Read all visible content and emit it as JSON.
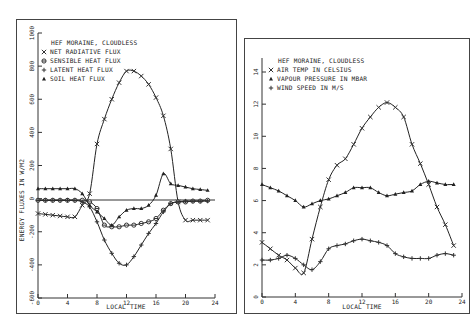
{
  "chart_data": [
    {
      "type": "line",
      "title": "HEF MORAINE, CLOUDLESS",
      "xlabel": "LOCAL TIME",
      "ylabel": "ENERGY FLUXES IN W/M2",
      "xlim": [
        0,
        24
      ],
      "ylim": [
        -600,
        1000
      ],
      "x_ticks": [
        "0",
        "4",
        "8",
        "12",
        "16",
        "20",
        "24"
      ],
      "y_ticks": [
        "1000",
        "800",
        "600",
        "400",
        "200",
        "0",
        "-200",
        "-400",
        "-600"
      ],
      "grid": false,
      "zero_line": true,
      "legend_position": "upper-left",
      "x": [
        0,
        1,
        2,
        3,
        4,
        5,
        6,
        7,
        8,
        9,
        10,
        11,
        12,
        13,
        14,
        15,
        16,
        17,
        18,
        19,
        20,
        21,
        22,
        23
      ],
      "series": [
        {
          "name": "NET RADIATIVE FLUX",
          "marker": "x",
          "values": [
            -90,
            -95,
            -100,
            -105,
            -110,
            -110,
            -40,
            30,
            330,
            480,
            600,
            700,
            770,
            770,
            740,
            690,
            610,
            500,
            300,
            -20,
            -130,
            -130,
            -130,
            -130
          ]
        },
        {
          "name": "SENSIBLE HEAT FLUX",
          "marker": "circle",
          "values": [
            -10,
            -10,
            -10,
            -10,
            -10,
            -10,
            -10,
            -20,
            -60,
            -160,
            -170,
            -170,
            -160,
            -160,
            -150,
            -140,
            -120,
            -70,
            -30,
            -20,
            -20,
            -15,
            -15,
            -10
          ]
        },
        {
          "name": "LATENT HEAT FLUX",
          "marker": "plus",
          "values": [
            -10,
            -10,
            -10,
            -10,
            -10,
            -10,
            -20,
            -50,
            -140,
            -250,
            -330,
            -390,
            -400,
            -350,
            -280,
            -210,
            -150,
            -80,
            -30,
            -20,
            -15,
            -15,
            -15,
            -15
          ]
        },
        {
          "name": "SOIL HEAT FLUX",
          "marker": "triangle",
          "values": [
            60,
            60,
            60,
            60,
            60,
            60,
            30,
            -40,
            -80,
            -120,
            -160,
            -110,
            -70,
            -60,
            -60,
            -40,
            20,
            150,
            90,
            80,
            70,
            60,
            55,
            50
          ]
        }
      ]
    },
    {
      "type": "line",
      "title": "HEF MORAINE, CLOUDLESS",
      "xlabel": "LOCAL TIME",
      "ylabel": "",
      "xlim": [
        0,
        24
      ],
      "ylim": [
        0,
        14
      ],
      "x_ticks": [
        "0",
        "4",
        "8",
        "12",
        "16",
        "20",
        "24"
      ],
      "y_ticks": [
        "14",
        "12",
        "10",
        "8",
        "6",
        "4",
        "2",
        "0"
      ],
      "grid": false,
      "legend_position": "upper-left",
      "x": [
        0,
        1,
        2,
        3,
        4,
        5,
        6,
        7,
        8,
        9,
        10,
        11,
        12,
        13,
        14,
        15,
        16,
        17,
        18,
        19,
        20,
        21,
        22,
        23
      ],
      "series": [
        {
          "name": "AIR TEMP IN CELSIUS",
          "marker": "x",
          "values": [
            3.4,
            3.0,
            2.6,
            2.3,
            1.8,
            1.5,
            3.6,
            5.6,
            7.3,
            8.2,
            8.6,
            9.5,
            10.5,
            11.2,
            11.8,
            12.1,
            11.8,
            11.2,
            9.5,
            8.3,
            7.0,
            5.6,
            4.5,
            3.2
          ]
        },
        {
          "name": "VAPOUR PRESSURE IN MBAR",
          "marker": "triangle",
          "values": [
            7.0,
            6.8,
            6.6,
            6.3,
            6.0,
            5.6,
            5.8,
            6.0,
            6.1,
            6.3,
            6.5,
            6.8,
            6.8,
            6.8,
            6.5,
            6.3,
            6.4,
            6.5,
            6.6,
            7.0,
            7.2,
            7.1,
            7.0,
            7.0
          ]
        },
        {
          "name": "WIND SPEED IN M/S",
          "marker": "plus",
          "values": [
            2.3,
            2.3,
            2.4,
            2.6,
            2.4,
            2.0,
            1.7,
            2.2,
            3.0,
            3.2,
            3.3,
            3.5,
            3.6,
            3.5,
            3.4,
            3.2,
            2.7,
            2.5,
            2.4,
            2.4,
            2.4,
            2.6,
            2.7,
            2.6
          ]
        }
      ]
    }
  ],
  "left": {
    "title": "HEF MORAINE, CLOUDLESS",
    "ylabel": "ENERGY FLUXES IN W/M2",
    "xlabel": "LOCAL TIME",
    "legend": [
      "NET RADIATIVE FLUX",
      "SENSIBLE HEAT FLUX",
      "LATENT HEAT FLUX",
      "SOIL HEAT FLUX"
    ],
    "legend_markers": [
      "×",
      "⊙",
      "+",
      "▲"
    ],
    "y_ticks": [
      "1000",
      "800",
      "600",
      "400",
      "200",
      "0",
      "-200",
      "-400",
      "-600"
    ],
    "x_ticks": [
      "0",
      "4",
      "8",
      "12",
      "16",
      "20",
      "24"
    ]
  },
  "right": {
    "title": "HEF MORAINE, CLOUDLESS",
    "xlabel": "LOCAL TIME",
    "legend": [
      "AIR TEMP IN CELSIUS",
      "VAPOUR PRESSURE IN MBAR",
      "WIND SPEED IN M/S"
    ],
    "legend_markers": [
      "×",
      "▲",
      "+"
    ],
    "y_ticks": [
      "14",
      "12",
      "10",
      "8",
      "6",
      "4",
      "2",
      "0"
    ],
    "x_ticks": [
      "0",
      "4",
      "8",
      "12",
      "16",
      "20",
      "24"
    ]
  }
}
